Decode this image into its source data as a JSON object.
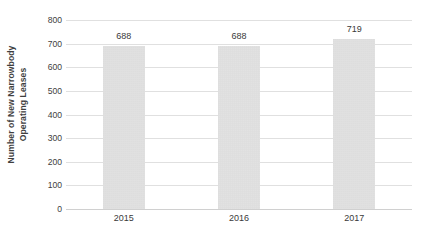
{
  "chart_data": {
    "type": "bar",
    "title": "",
    "subtitle": "",
    "xlabel": "",
    "ylabel": "Number of New Narrowbody Operating Leases",
    "ylabel_lines": [
      "Number of New Narrowbody",
      "Operating Leases"
    ],
    "categories": [
      "2015",
      "2016",
      "2017"
    ],
    "values": [
      688,
      688,
      719
    ],
    "data_labels": [
      "688",
      "688",
      "719"
    ],
    "ylim": [
      0,
      800
    ],
    "ytick_values": [
      800,
      700,
      600,
      500,
      400,
      300,
      200,
      100,
      0
    ],
    "ytick_labels": [
      "800",
      "700",
      "600",
      "500",
      "400",
      "300",
      "200",
      "100",
      "0"
    ],
    "grid": true,
    "grid_axis": "y",
    "legend": false,
    "legend_position": "none",
    "colors": {
      "bar_fill": "#d5d5d5",
      "gridline": "#e0e0e0",
      "axis_text": "#3a3a3a",
      "label_text": "#3f3f3f",
      "background": "#ffffff"
    }
  }
}
